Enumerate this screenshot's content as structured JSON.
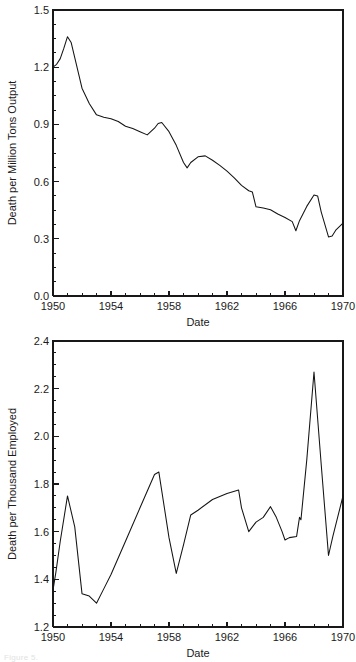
{
  "figure": {
    "caption_fragment": "Figure 5."
  },
  "chart_data": [
    {
      "id": "deaths-per-million-tons-output",
      "type": "line",
      "title": "",
      "xlabel": "Date",
      "ylabel": "Death per Million Tons Output",
      "xlim": [
        1950,
        1970
      ],
      "ylim": [
        0.0,
        1.5
      ],
      "grid": false,
      "legend": "none",
      "xticks": [
        1950,
        1954,
        1958,
        1962,
        1966,
        1970
      ],
      "xtick_labels": [
        "1950",
        "1954",
        "1958",
        "1962",
        "1966",
        "1970"
      ],
      "xminor_interval": 1,
      "yticks": [
        0.0,
        0.3,
        0.6,
        0.9,
        1.2,
        1.5
      ],
      "ytick_labels": [
        "0.0",
        "0.3",
        "0.6",
        "0.9",
        "1.2",
        "1.5"
      ],
      "yminor_interval": 0.075,
      "series": [
        {
          "name": "Death per Million Tons Output",
          "x": [
            1950.0,
            1950.25,
            1950.5,
            1950.75,
            1951.0,
            1951.25,
            1951.5,
            1951.75,
            1952.0,
            1952.5,
            1953.0,
            1953.5,
            1954.0,
            1954.5,
            1955.0,
            1955.5,
            1956.0,
            1956.5,
            1957.0,
            1957.25,
            1957.5,
            1958.0,
            1958.5,
            1959.0,
            1959.25,
            1959.5,
            1960.0,
            1960.5,
            1961.0,
            1961.5,
            1962.0,
            1962.5,
            1963.0,
            1963.5,
            1963.75,
            1964.0,
            1964.5,
            1965.0,
            1965.5,
            1966.0,
            1966.5,
            1966.75,
            1967.0,
            1967.5,
            1968.0,
            1968.25,
            1968.5,
            1969.0,
            1969.25,
            1969.5,
            1970.0
          ],
          "y": [
            1.2,
            1.215,
            1.245,
            1.3,
            1.36,
            1.33,
            1.25,
            1.17,
            1.09,
            1.01,
            0.95,
            0.938,
            0.93,
            0.915,
            0.89,
            0.878,
            0.862,
            0.845,
            0.88,
            0.905,
            0.91,
            0.862,
            0.79,
            0.7,
            0.672,
            0.7,
            0.73,
            0.735,
            0.712,
            0.685,
            0.655,
            0.62,
            0.58,
            0.552,
            0.545,
            0.468,
            0.462,
            0.452,
            0.43,
            0.412,
            0.39,
            0.342,
            0.395,
            0.47,
            0.53,
            0.525,
            0.44,
            0.31,
            0.315,
            0.345,
            0.382
          ]
        }
      ]
    },
    {
      "id": "deaths-per-thousand-employed",
      "type": "line",
      "title": "",
      "xlabel": "Date",
      "ylabel": "Death per Thousand Employed",
      "xlim": [
        1950,
        1970
      ],
      "ylim": [
        1.2,
        2.4
      ],
      "grid": false,
      "legend": "none",
      "xticks": [
        1950,
        1954,
        1958,
        1962,
        1966,
        1970
      ],
      "xtick_labels": [
        "1950",
        "1954",
        "1958",
        "1962",
        "1966",
        "1970"
      ],
      "xminor_interval": 1,
      "yticks": [
        1.2,
        1.4,
        1.6,
        1.8,
        2.0,
        2.2,
        2.4
      ],
      "ytick_labels": [
        "1.2",
        "1.4",
        "1.6",
        "1.8",
        "2.0",
        "2.2",
        "2.4"
      ],
      "yminor_interval": 0.05,
      "series": [
        {
          "name": "Death per Thousand Employed",
          "x": [
            1950.0,
            1950.2,
            1950.5,
            1951.0,
            1951.5,
            1952.0,
            1952.5,
            1953.0,
            1953.5,
            1954.0,
            1955.0,
            1956.0,
            1957.0,
            1957.3,
            1958.0,
            1958.5,
            1959.0,
            1959.5,
            1960.0,
            1961.0,
            1962.0,
            1962.8,
            1963.0,
            1963.5,
            1964.0,
            1964.5,
            1965.0,
            1965.4,
            1965.8,
            1966.0,
            1966.3,
            1966.8,
            1967.0,
            1967.1,
            1967.5,
            1968.0,
            1968.5,
            1969.0,
            1969.3,
            1970.0
          ],
          "y": [
            1.355,
            1.43,
            1.56,
            1.75,
            1.62,
            1.34,
            1.33,
            1.3,
            1.36,
            1.42,
            1.56,
            1.7,
            1.84,
            1.85,
            1.575,
            1.425,
            1.545,
            1.67,
            1.69,
            1.735,
            1.76,
            1.775,
            1.7,
            1.6,
            1.64,
            1.66,
            1.705,
            1.66,
            1.6,
            1.565,
            1.575,
            1.58,
            1.66,
            1.65,
            1.9,
            2.27,
            1.88,
            1.5,
            1.58,
            1.75
          ]
        }
      ]
    }
  ]
}
